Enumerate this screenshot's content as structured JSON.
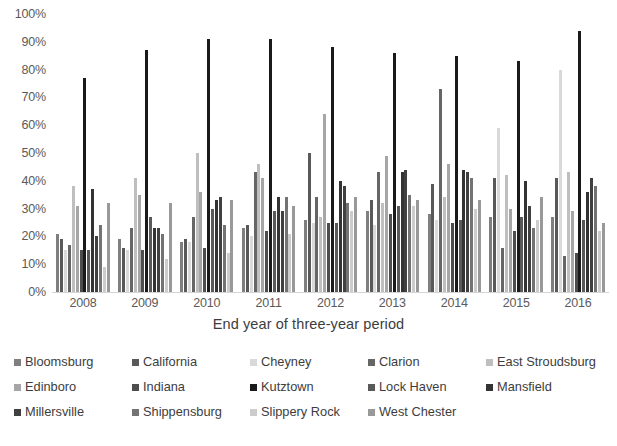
{
  "chart_data": {
    "type": "bar",
    "title": "",
    "subtitle": "",
    "xlabel": "End year of three-year period",
    "ylabel": "",
    "categories": [
      "2008",
      "2009",
      "2010",
      "2011",
      "2012",
      "2013",
      "2014",
      "2015",
      "2016"
    ],
    "ylim": [
      0,
      100
    ],
    "ytick_values": [
      0,
      10,
      20,
      30,
      40,
      50,
      60,
      70,
      80,
      90,
      100
    ],
    "ytick_labels": [
      "0%",
      "10%",
      "20%",
      "30%",
      "40%",
      "50%",
      "60%",
      "70%",
      "80%",
      "90%",
      "100%"
    ],
    "grid": false,
    "legend_position": "bottom",
    "value_unit": "percent",
    "series": [
      {
        "name": "Bloomsburg",
        "color": "#7f7f7f",
        "values": [
          21,
          19,
          18,
          23,
          26,
          29,
          28,
          27,
          27
        ]
      },
      {
        "name": "California",
        "color": "#595959",
        "values": [
          19,
          16,
          19,
          24,
          50,
          33,
          39,
          41,
          41
        ]
      },
      {
        "name": "Cheyney",
        "color": "#d9d9d9",
        "values": [
          15,
          15,
          18,
          20,
          25,
          24,
          26,
          59,
          80
        ]
      },
      {
        "name": "Clarion",
        "color": "#666666",
        "values": [
          17,
          23,
          27,
          43,
          34,
          43,
          73,
          16,
          13
        ]
      },
      {
        "name": "East Stroudsburg",
        "color": "#bfbfbf",
        "values": [
          38,
          41,
          50,
          46,
          27,
          32,
          34,
          42,
          43
        ]
      },
      {
        "name": "Edinboro",
        "color": "#a6a6a6",
        "values": [
          31,
          35,
          36,
          41,
          64,
          49,
          46,
          30,
          29
        ]
      },
      {
        "name": "Indiana",
        "color": "#4d4d4d",
        "values": [
          15,
          15,
          16,
          22,
          25,
          28,
          25,
          22,
          14
        ]
      },
      {
        "name": "Kutztown",
        "color": "#1a1a1a",
        "values": [
          77,
          87,
          91,
          91,
          88,
          86,
          85,
          83,
          94
        ]
      },
      {
        "name": "Lock Haven",
        "color": "#595959",
        "values": [
          15,
          27,
          30,
          29,
          25,
          31,
          26,
          27,
          26
        ]
      },
      {
        "name": "Mansfield",
        "color": "#333333",
        "values": [
          37,
          23,
          33,
          34,
          40,
          43,
          44,
          40,
          36
        ]
      },
      {
        "name": "Millersville",
        "color": "#404040",
        "values": [
          20,
          23,
          34,
          29,
          38,
          44,
          43,
          31,
          41
        ]
      },
      {
        "name": "Shippensburg",
        "color": "#737373",
        "values": [
          24,
          21,
          24,
          34,
          32,
          35,
          41,
          23,
          38
        ]
      },
      {
        "name": "Slippery Rock",
        "color": "#cccccc",
        "values": [
          9,
          12,
          14,
          21,
          29,
          31,
          30,
          26,
          22
        ]
      },
      {
        "name": "West Chester",
        "color": "#999999",
        "values": [
          32,
          32,
          33,
          31,
          34,
          33,
          33,
          34,
          25
        ]
      }
    ]
  },
  "legend": {
    "rows": [
      [
        "Bloomsburg",
        "California",
        "Cheyney",
        "Clarion",
        "East Stroudsburg"
      ],
      [
        "Edinboro",
        "Indiana",
        "Kutztown",
        "Lock Haven",
        "Mansfield"
      ],
      [
        "Millersville",
        "Shippensburg",
        "Slippery Rock",
        "West Chester"
      ]
    ]
  }
}
